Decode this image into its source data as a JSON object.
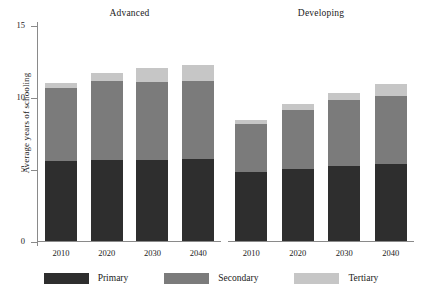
{
  "chart_data": {
    "type": "bar",
    "subtype": "stacked-bar-panelled",
    "title": "",
    "xlabel": "",
    "ylabel": "Average years of schooling",
    "ylim": [
      0,
      15
    ],
    "yticks": [
      0,
      5,
      10,
      15
    ],
    "ytick_labels": [
      "0",
      "5",
      "10",
      "15"
    ],
    "grid": false,
    "legend_position": "bottom",
    "categories": [
      "2010",
      "2020",
      "2030",
      "2040"
    ],
    "series_names": [
      "Primary",
      "Secondary",
      "Tertiary"
    ],
    "colors": {
      "primary": "#2e2e2e",
      "secondary": "#7b7b7b",
      "tertiary": "#c6c6c6",
      "axis": "#8a8a8a",
      "background": "#ffffff",
      "text": "#1a1a1a"
    },
    "panels": [
      {
        "name": "Advanced",
        "categories": [
          "2010",
          "2020",
          "2030",
          "2040"
        ],
        "series": [
          {
            "name": "Primary",
            "values": [
              5.55,
              5.6,
              5.65,
              5.7
            ]
          },
          {
            "name": "Secondary",
            "values": [
              5.05,
              5.5,
              5.4,
              5.4
            ]
          },
          {
            "name": "Tertiary",
            "values": [
              0.4,
              0.6,
              0.95,
              1.1
            ]
          }
        ],
        "totals": [
          11.0,
          11.7,
          12.0,
          12.2
        ]
      },
      {
        "name": "Developing",
        "categories": [
          "2010",
          "2020",
          "2030",
          "2040"
        ],
        "series": [
          {
            "name": "Primary",
            "values": [
              4.8,
              5.0,
              5.2,
              5.35
            ]
          },
          {
            "name": "Secondary",
            "values": [
              3.35,
              4.1,
              4.6,
              4.7
            ]
          },
          {
            "name": "Tertiary",
            "values": [
              0.25,
              0.4,
              0.5,
              0.85
            ]
          }
        ],
        "totals": [
          8.4,
          9.5,
          10.3,
          10.9
        ]
      }
    ]
  },
  "axis": {
    "y_title": "Average years of schooling",
    "y_labels": [
      "15",
      "10",
      "5",
      "0"
    ]
  },
  "panels": {
    "advanced_title": "Advanced",
    "developing_title": "Developing"
  },
  "legend": {
    "items": [
      {
        "label": "Primary"
      },
      {
        "label": "Secondary"
      },
      {
        "label": "Tertiary"
      }
    ]
  }
}
